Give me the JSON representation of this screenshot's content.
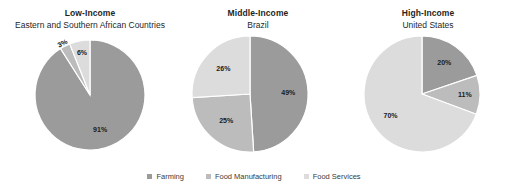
{
  "chart_data": {
    "type": "pie",
    "title": "",
    "legend_position": "bottom",
    "series_names": [
      "Farming",
      "Food Manufacturing",
      "Food Services"
    ],
    "colors": {
      "farming": "#9b9b9b",
      "food_manufacturing": "#bcbcbc",
      "food_services": "#dcdcdc",
      "background": "#ffffff",
      "label_text": "#1a1a1a"
    },
    "charts": [
      {
        "title": "Low-Income",
        "subtitle": "Eastern and Southern African Countries",
        "categories": [
          "Farming",
          "Food Manufacturing",
          "Food Services"
        ],
        "values": [
          91,
          3,
          6
        ],
        "labels": [
          "91%",
          "3%",
          "6%"
        ]
      },
      {
        "title": "Middle-Income",
        "subtitle": "Brazil",
        "categories": [
          "Farming",
          "Food Manufacturing",
          "Food Services"
        ],
        "values": [
          49,
          25,
          26
        ],
        "labels": [
          "49%",
          "25%",
          "26%"
        ]
      },
      {
        "title": "High-Income",
        "subtitle": "United States",
        "categories": [
          "Farming",
          "Food Manufacturing",
          "Food Services"
        ],
        "values": [
          20,
          11,
          70
        ],
        "labels": [
          "20%",
          "11%",
          "70%"
        ]
      }
    ]
  },
  "legend": {
    "items": [
      {
        "label": "Farming",
        "color": "#9b9b9b"
      },
      {
        "label": "Food Manufacturing",
        "color": "#bcbcbc"
      },
      {
        "label": "Food Services",
        "color": "#dcdcdc"
      }
    ]
  }
}
